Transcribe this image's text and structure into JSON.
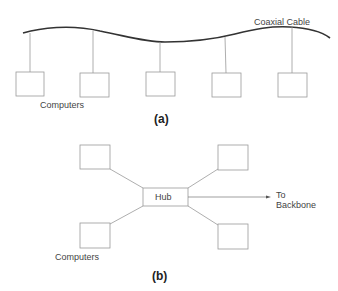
{
  "diagram_a": {
    "caption": "(a)",
    "cable_label": "Coaxial Cable",
    "computers_label": "Computers",
    "topology": "bus",
    "computer_count": 5
  },
  "diagram_b": {
    "caption": "(b)",
    "hub_label": "Hub",
    "backbone_label_line1": "To",
    "backbone_label_line2": "Backbone",
    "computers_label": "Computers",
    "topology": "star",
    "computer_count": 4
  },
  "colors": {
    "cable": "#333333",
    "lines": "#999999",
    "boxes": "#999999",
    "text": "#444444"
  }
}
